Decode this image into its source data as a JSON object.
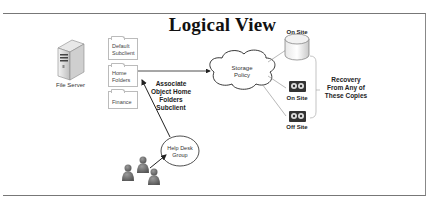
{
  "diagram": {
    "title": "Logical View",
    "file_server": {
      "label": "File Server",
      "icon": "server-tower-icon"
    },
    "subclients": [
      {
        "label_line1": "Default",
        "label_line2": "Subclient"
      },
      {
        "label_line1": "Home",
        "label_line2": "Folders"
      },
      {
        "label_line1": "Finance",
        "label_line2": ""
      }
    ],
    "storage_policy": {
      "label_line1": "Storage",
      "label_line2": "Policy",
      "icon": "cloud-icon"
    },
    "copies": [
      {
        "label": "On Site",
        "icon": "disk-cylinder-icon"
      },
      {
        "label": "On Site",
        "icon": "tape-cartridge-icon"
      },
      {
        "label": "Off Site",
        "icon": "tape-cartridge-icon"
      }
    ],
    "recovery_note": {
      "line1": "Recovery",
      "line2": "From Any of",
      "line3": "These Copies"
    },
    "associate_note": {
      "line1": "Associate",
      "line2": "Object Home",
      "line3": "Folders",
      "line4": "Subclient"
    },
    "help_desk": {
      "label_line1": "Help Desk",
      "label_line2": "Group",
      "icon": "users-group-icon"
    }
  },
  "colors": {
    "frame": "#777777",
    "line": "#222222",
    "gray_line": "#999999",
    "tape": "#333333"
  }
}
